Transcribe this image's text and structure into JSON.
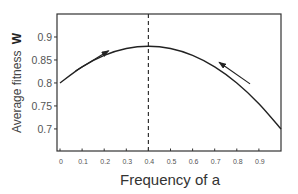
{
  "chart_data": {
    "type": "line",
    "title": "",
    "xlabel": "Frequency of a",
    "ylabel": "Average fitness",
    "ylabel_symbol": "W",
    "xlim": [
      0,
      1.0
    ],
    "ylim": [
      0.652,
      0.95
    ],
    "xticks": [
      0,
      0.1,
      0.2,
      0.3,
      0.4,
      0.5,
      0.6,
      0.7,
      0.8,
      0.9
    ],
    "xtick_labels": [
      "0",
      "0.1",
      "0.2",
      "0.3",
      "0.4",
      "0.5",
      "0.6",
      "0.7",
      "0.8",
      "0.9"
    ],
    "yticks": [
      0.7,
      0.75,
      0.8,
      0.85,
      0.9
    ],
    "ytick_labels": [
      "0.7",
      "0.75",
      "0.8",
      "0.85",
      "0.9"
    ],
    "grid": false,
    "legend": "none",
    "series": [
      {
        "name": "Average fitness",
        "x": [
          0,
          0.1,
          0.2,
          0.3,
          0.4,
          0.5,
          0.6,
          0.7,
          0.8,
          0.9,
          1.0
        ],
        "values": [
          0.8,
          0.835,
          0.86,
          0.875,
          0.88,
          0.875,
          0.86,
          0.835,
          0.8,
          0.755,
          0.7
        ],
        "color": "#222222"
      }
    ],
    "annotations": [
      {
        "type": "vline",
        "x": 0.4,
        "style": "dashed",
        "label": "equilibrium"
      },
      {
        "type": "arrow",
        "direction": "increasing",
        "from": [
          0.07,
          0.826
        ],
        "to": [
          0.22,
          0.87
        ]
      },
      {
        "type": "arrow",
        "direction": "decreasing",
        "from": [
          0.86,
          0.798
        ],
        "to": [
          0.72,
          0.845
        ]
      }
    ]
  }
}
